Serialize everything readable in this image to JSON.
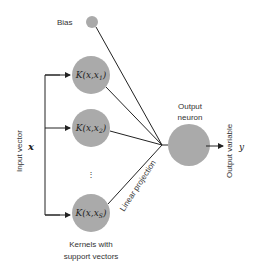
{
  "diagram": {
    "bias_label": "Bias",
    "input_label": "Input vector",
    "input_symbol": "x",
    "kernels": [
      {
        "label": "K(x,x",
        "sub": "1",
        "close": ")"
      },
      {
        "label": "K(x,x",
        "sub": "2",
        "close": ")"
      },
      {
        "label": "K(x,x",
        "sub": "S",
        "close": ")"
      }
    ],
    "ellipsis": "⋮",
    "kernels_caption_line1": "Kernels with",
    "kernels_caption_line2": "support vectors",
    "output_neuron_line1": "Output",
    "output_neuron_line2": "neuron",
    "projection_label": "Linear projection",
    "output_label": "Output variable",
    "output_symbol": "y",
    "colors": {
      "node": "#aaaaaa",
      "edge": "#222222",
      "text": "#333333"
    }
  }
}
